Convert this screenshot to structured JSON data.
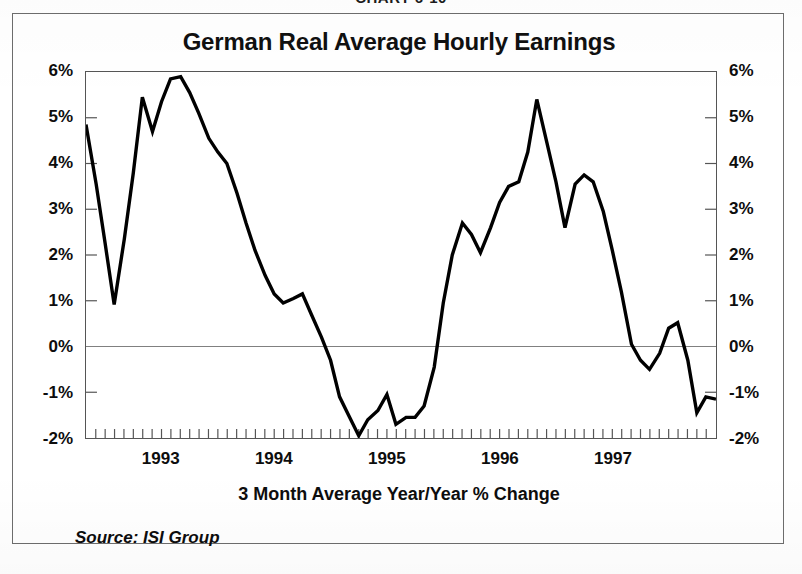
{
  "page": {
    "chart_number": "CHART 6-10"
  },
  "figure": {
    "title": "German Real Average Hourly Earnings",
    "x_axis_caption": "3 Month Average Year/Year % Change",
    "source": "Source: ISI Group"
  },
  "axis": {
    "y_ticks": [
      "6%",
      "5%",
      "4%",
      "3%",
      "2%",
      "1%",
      "0%",
      "-1%",
      "-2%"
    ],
    "y_values": [
      6,
      5,
      4,
      3,
      2,
      1,
      0,
      -1,
      -2
    ],
    "x_years": [
      "1993",
      "1994",
      "1995",
      "1996",
      "1997"
    ],
    "x_year_positions": [
      1993,
      1994,
      1995,
      1996,
      1997
    ]
  },
  "style": {
    "line_color": "#000000",
    "frame_color": "#6d6d6d",
    "axis_color": "#555555",
    "zero_line_color": "#808080",
    "background": "#ffffff"
  },
  "chart_data": {
    "type": "line",
    "title": "German Real Average Hourly Earnings",
    "subtitle": "3 Month Average Year/Year % Change",
    "xlabel": "",
    "ylabel": "",
    "ylim": [
      -2,
      6
    ],
    "xlim": [
      1992.33,
      1997.92
    ],
    "grid": false,
    "legend": false,
    "y_tick_labels": [
      "-2%",
      "-1%",
      "0%",
      "1%",
      "2%",
      "3%",
      "4%",
      "5%",
      "6%"
    ],
    "y_tick_values": [
      -2,
      -1,
      0,
      1,
      2,
      3,
      4,
      5,
      6
    ],
    "x_tick_interval_months": 1,
    "annotations": [
      "Source: ISI Group"
    ],
    "series": [
      {
        "name": "German Real Average Hourly Earnings",
        "units": "percent",
        "x": [
          1992.33,
          1992.42,
          1992.5,
          1992.58,
          1992.67,
          1992.75,
          1992.83,
          1992.92,
          1993.0,
          1993.08,
          1993.17,
          1993.25,
          1993.33,
          1993.42,
          1993.5,
          1993.58,
          1993.67,
          1993.75,
          1993.83,
          1993.92,
          1994.0,
          1994.08,
          1994.17,
          1994.25,
          1994.33,
          1994.42,
          1994.5,
          1994.58,
          1994.67,
          1994.75,
          1994.83,
          1994.92,
          1995.0,
          1995.08,
          1995.17,
          1995.25,
          1995.33,
          1995.42,
          1995.5,
          1995.58,
          1995.67,
          1995.75,
          1995.83,
          1995.92,
          1996.0,
          1996.08,
          1996.17,
          1996.25,
          1996.33,
          1996.42,
          1996.5,
          1996.58,
          1996.67,
          1996.75,
          1996.83,
          1996.92,
          1997.0,
          1997.08,
          1997.17,
          1997.25,
          1997.33,
          1997.42,
          1997.5,
          1997.58,
          1997.67,
          1997.75,
          1997.83,
          1997.92
        ],
        "y": [
          4.85,
          3.55,
          2.25,
          0.92,
          2.35,
          3.8,
          5.45,
          4.7,
          5.35,
          5.85,
          5.9,
          5.55,
          5.1,
          4.55,
          4.25,
          4.0,
          3.35,
          2.7,
          2.1,
          1.55,
          1.15,
          0.95,
          1.05,
          1.15,
          0.7,
          0.2,
          -0.3,
          -1.1,
          -1.55,
          -1.95,
          -1.6,
          -1.4,
          -1.05,
          -1.7,
          -1.55,
          -1.55,
          -1.3,
          -0.45,
          0.95,
          2.0,
          2.7,
          2.45,
          2.05,
          2.6,
          3.15,
          3.5,
          3.6,
          4.25,
          5.4,
          4.45,
          3.6,
          2.6,
          3.55,
          3.75,
          3.6,
          2.95,
          2.1,
          1.2,
          0.05,
          -0.3,
          -0.5,
          -0.15,
          0.4,
          0.52,
          -0.3,
          -1.45,
          -1.1,
          -1.15
        ]
      }
    ]
  }
}
